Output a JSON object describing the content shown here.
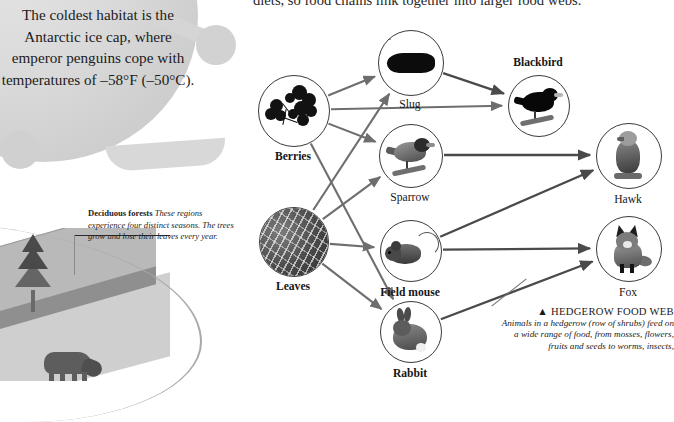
{
  "page": {
    "top_sentence": "diets, so food chains link together into larger food webs."
  },
  "fact_bubble": {
    "text": "The coldest habitat is the Antarctic ice cap, where emperor penguins cope with temperatures of –58°F (–50°C)."
  },
  "forest_note": {
    "term": "Deciduous forests",
    "body": " These regions experience four distinct seasons. The trees grow and lose their leaves every year."
  },
  "web_caption": {
    "marker": "▲",
    "title": "HEDGEROW FOOD WEB",
    "body": "Animals in a hedgerow (row of shrubs) feed on a wide range of food, from mosses, flowers, fruits and seeds to worms, insects,"
  },
  "food_web": {
    "nodes": [
      {
        "id": "berries",
        "label": "Berries",
        "cx": 293,
        "cy": 110,
        "r": 35,
        "label_dy": 47,
        "bold": true,
        "art": "berries"
      },
      {
        "id": "leaves",
        "label": "Leaves",
        "cx": 293,
        "cy": 241,
        "r": 34,
        "label_dy": 46,
        "bold": true,
        "art": "leaves"
      },
      {
        "id": "slug",
        "label": "Slug",
        "cx": 410,
        "cy": 62,
        "r": 32,
        "label_dy": 43,
        "bold": false,
        "art": "slug"
      },
      {
        "id": "sparrow",
        "label": "Sparrow",
        "cx": 410,
        "cy": 155,
        "r": 31,
        "label_dy": 43,
        "bold": false,
        "art": "sparrow"
      },
      {
        "id": "fieldmouse",
        "label": "Field mouse",
        "cx": 410,
        "cy": 250,
        "r": 30,
        "label_dy": 43,
        "bold": true,
        "art": "mouse"
      },
      {
        "id": "rabbit",
        "label": "Rabbit",
        "cx": 410,
        "cy": 331,
        "r": 30,
        "label_dy": 43,
        "bold": true,
        "art": "rabbit"
      },
      {
        "id": "blackbird",
        "label": "Blackbird",
        "cx": 538,
        "cy": 105,
        "r": 30,
        "label_dy": -42,
        "bold": true,
        "art": "blackbird"
      },
      {
        "id": "hawk",
        "label": "Hawk",
        "cx": 628,
        "cy": 155,
        "r": 32,
        "label_dy": 45,
        "bold": false,
        "art": "hawk"
      },
      {
        "id": "fox",
        "label": "Fox",
        "cx": 628,
        "cy": 248,
        "r": 32,
        "label_dy": 45,
        "bold": false,
        "art": "fox"
      }
    ],
    "links": [
      {
        "from": "berries",
        "to": "slug"
      },
      {
        "from": "berries",
        "to": "sparrow"
      },
      {
        "from": "berries",
        "to": "blackbird"
      },
      {
        "from": "berries",
        "to": "rabbit"
      },
      {
        "from": "leaves",
        "to": "slug"
      },
      {
        "from": "leaves",
        "to": "sparrow"
      },
      {
        "from": "leaves",
        "to": "fieldmouse"
      },
      {
        "from": "leaves",
        "to": "rabbit"
      },
      {
        "from": "slug",
        "to": "blackbird"
      },
      {
        "from": "sparrow",
        "to": "hawk"
      },
      {
        "from": "fieldmouse",
        "to": "hawk"
      },
      {
        "from": "fieldmouse",
        "to": "fox"
      },
      {
        "from": "rabbit",
        "to": "fox"
      }
    ],
    "arrow_color": "#6e6e6e",
    "arrow_color_dark": "#4a4a4a"
  }
}
